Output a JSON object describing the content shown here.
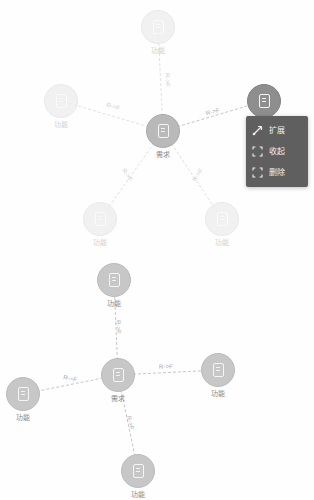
{
  "canvas": {
    "background_color": "#fefefe",
    "accent_color": "#8e8e8e",
    "menu_background_color": "#5f5f5f"
  },
  "graphs": [
    {
      "id": "graph-top",
      "nodes": [
        {
          "id": "t-center",
          "label": "需求",
          "icon": "document-icon",
          "state": "center",
          "x": 163,
          "y": 131
        },
        {
          "id": "t-n-top",
          "label": "功能",
          "icon": "document-icon",
          "state": "faded",
          "x": 158,
          "y": 27
        },
        {
          "id": "t-n-left",
          "label": "功能",
          "icon": "document-icon",
          "state": "faded",
          "x": 61,
          "y": 101
        },
        {
          "id": "t-n-right",
          "label": "功能",
          "icon": "document-icon",
          "state": "selected",
          "x": 264,
          "y": 101
        },
        {
          "id": "t-n-bl",
          "label": "功能",
          "icon": "document-icon",
          "state": "faded",
          "x": 100,
          "y": 219
        },
        {
          "id": "t-n-br",
          "label": "功能",
          "icon": "document-icon",
          "state": "faded",
          "x": 222,
          "y": 219
        }
      ],
      "edges": [
        {
          "id": "t-e-top",
          "from": "t-center",
          "to": "t-n-top",
          "label": "R->F",
          "label_x": 167,
          "label_y": 80,
          "label_rotate": 87,
          "faint": true
        },
        {
          "id": "t-e-left",
          "from": "t-center",
          "to": "t-n-left",
          "label": "R->F",
          "label_x": 113,
          "label_y": 107,
          "label_rotate": 17,
          "faint": true
        },
        {
          "id": "t-e-right",
          "from": "t-center",
          "to": "t-n-right",
          "label": "R->F",
          "label_x": 213,
          "label_y": 112,
          "label_rotate": -14,
          "faint": false
        },
        {
          "id": "t-e-bl",
          "from": "t-center",
          "to": "t-n-bl",
          "label": "R->F",
          "label_x": 127,
          "label_y": 175,
          "label_rotate": 57,
          "faint": true
        },
        {
          "id": "t-e-br",
          "from": "t-center",
          "to": "t-n-br",
          "label": "R->F",
          "label_x": 198,
          "label_y": 175,
          "label_rotate": -57,
          "faint": true
        }
      ]
    },
    {
      "id": "graph-bottom",
      "nodes": [
        {
          "id": "b-center",
          "label": "需求",
          "icon": "document-icon",
          "state": "solid",
          "x": 118,
          "y": 375
        },
        {
          "id": "b-n-top",
          "label": "功能",
          "icon": "document-icon",
          "state": "solid",
          "x": 114,
          "y": 280
        },
        {
          "id": "b-n-left",
          "label": "功能",
          "icon": "document-icon",
          "state": "solid",
          "x": 23,
          "y": 394
        },
        {
          "id": "b-n-right",
          "label": "功能",
          "icon": "document-icon",
          "state": "solid",
          "x": 218,
          "y": 370
        },
        {
          "id": "b-n-bottom",
          "label": "功能",
          "icon": "document-icon",
          "state": "solid",
          "x": 138,
          "y": 471
        }
      ],
      "edges": [
        {
          "id": "b-e-top",
          "from": "b-center",
          "to": "b-n-top",
          "label": "R->F",
          "label_x": 118,
          "label_y": 327,
          "label_rotate": 87,
          "faint": false
        },
        {
          "id": "b-e-left",
          "from": "b-center",
          "to": "b-n-left",
          "label": "R->F",
          "label_x": 70,
          "label_y": 379,
          "label_rotate": 12,
          "faint": false
        },
        {
          "id": "b-e-right",
          "from": "b-center",
          "to": "b-n-right",
          "label": "R->F",
          "label_x": 166,
          "label_y": 367,
          "label_rotate": -2,
          "faint": false
        },
        {
          "id": "b-e-bottom",
          "from": "b-center",
          "to": "b-n-bottom",
          "label": "R->F",
          "label_x": 130,
          "label_y": 423,
          "label_rotate": 76,
          "faint": false
        }
      ]
    }
  ],
  "context_menu": {
    "items": [
      {
        "id": "expand",
        "label": "扩展",
        "icon": "expand-arrow-icon"
      },
      {
        "id": "collapse",
        "label": "收起",
        "icon": "collapse-corners-icon"
      },
      {
        "id": "delete",
        "label": "删除",
        "icon": "delete-corners-icon"
      }
    ]
  }
}
